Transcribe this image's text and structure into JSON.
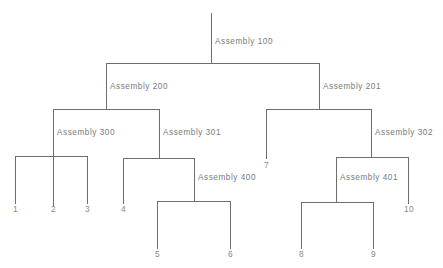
{
  "diagram": {
    "type": "tree",
    "line_color": "#6e6e6e",
    "label_color": "#7a7a7a",
    "background": "#ffffff",
    "assemblies": [
      {
        "id": "a100",
        "label": "Assembly 100",
        "x": 215,
        "y": 44
      },
      {
        "id": "a200",
        "label": "Assembly 200",
        "x": 110,
        "y": 89
      },
      {
        "id": "a201",
        "label": "Assembly 201",
        "x": 323,
        "y": 89
      },
      {
        "id": "a300",
        "label": "Assembly 300",
        "x": 57,
        "y": 135
      },
      {
        "id": "a301",
        "label": "Assembly 301",
        "x": 163,
        "y": 135
      },
      {
        "id": "a302",
        "label": "Assembly 302",
        "x": 375,
        "y": 135
      },
      {
        "id": "a400",
        "label": "Assembly 400",
        "x": 198,
        "y": 180
      },
      {
        "id": "a401",
        "label": "Assembly 401",
        "x": 340,
        "y": 180
      }
    ],
    "leaves": [
      {
        "id": "leaf-1",
        "label": "1",
        "x": 15,
        "y": 211
      },
      {
        "id": "leaf-2",
        "label": "2",
        "x": 53,
        "y": 211
      },
      {
        "id": "leaf-3",
        "label": "3",
        "x": 87,
        "y": 211
      },
      {
        "id": "leaf-4",
        "label": "4",
        "x": 123,
        "y": 211
      },
      {
        "id": "leaf-5",
        "label": "5",
        "x": 157,
        "y": 256
      },
      {
        "id": "leaf-6",
        "label": "6",
        "x": 230,
        "y": 256
      },
      {
        "id": "leaf-7",
        "label": "7",
        "x": 266,
        "y": 167
      },
      {
        "id": "leaf-8",
        "label": "8",
        "x": 301,
        "y": 256
      },
      {
        "id": "leaf-9",
        "label": "9",
        "x": 373,
        "y": 256
      },
      {
        "id": "leaf-10",
        "label": "10",
        "x": 406,
        "y": 211
      }
    ]
  }
}
